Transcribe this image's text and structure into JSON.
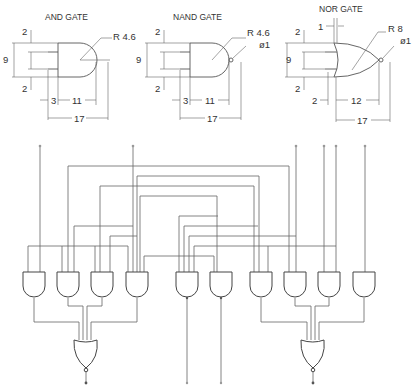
{
  "figures": {
    "and_gate": {
      "title": "AND GATE",
      "dims": {
        "top_gap": "2",
        "height": "9",
        "bottom_gap": "2",
        "radius": "R 4.6",
        "lead": "3",
        "body": "11",
        "total": "17"
      }
    },
    "nand_gate": {
      "title": "NAND GATE",
      "dims": {
        "top_gap": "2",
        "height": "9",
        "bottom_gap": "2",
        "radius": "R 4.6",
        "bubble": "ø1",
        "lead": "3",
        "body": "11",
        "total": "17"
      }
    },
    "nor_gate": {
      "title": "NOR GATE",
      "dims": {
        "offset": "1",
        "top_gap": "2",
        "height": "9",
        "bottom_gap": "2",
        "radius": "R 8",
        "bubble": "ø1",
        "lead": "2",
        "body": "12",
        "total": "17"
      }
    }
  },
  "circuit": {
    "and_gates_count": 11,
    "nor_gates_count": 2,
    "input_terminals": 6,
    "output_terminals": 4
  }
}
